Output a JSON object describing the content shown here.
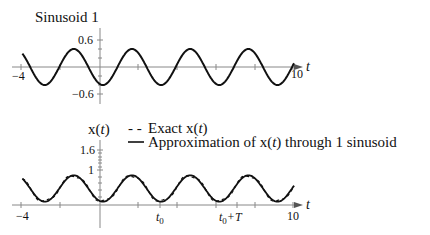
{
  "chart_data": [
    {
      "type": "line",
      "title": "Sinusoid 1",
      "xlabel": "t",
      "ylabel": "",
      "xlim": [
        -4,
        10
      ],
      "ylim": [
        -0.6,
        0.6
      ],
      "x_tick_labels": [
        "-4",
        "10"
      ],
      "y_tick_labels": [
        "0.6",
        "-0.6"
      ],
      "grid": false,
      "series": [
        {
          "name": "Sinusoid 1",
          "style": "solid",
          "amplitude": 0.4,
          "period": 3,
          "formula": "-0.4*cos(2*pi*(t-0.15)/3)"
        }
      ]
    },
    {
      "type": "line",
      "title": "",
      "xlabel": "t",
      "ylabel": "x(t)",
      "xlim": [
        -4,
        10
      ],
      "ylim": [
        0,
        1.6
      ],
      "x_tick_labels": [
        "-4",
        "t0",
        "t0+T",
        "10"
      ],
      "y_tick_labels": [
        "1.6",
        "1"
      ],
      "grid": false,
      "legend_position": "top-right",
      "series": [
        {
          "name": "Exact x(t)",
          "style": "dashed",
          "mean": 0.5,
          "amplitude": 0.4,
          "period": 3
        },
        {
          "name": "Approximation of x(t) through 1 sinusoid",
          "style": "solid",
          "mean": 0.5,
          "amplitude": 0.4,
          "period": 3
        }
      ]
    }
  ],
  "top": {
    "title": "Sinusoid 1",
    "ytick_pos": "0.6",
    "ytick_neg": "−0.6",
    "xtick_min": "−4",
    "xtick_max": "10",
    "xlabel": "t"
  },
  "bottom": {
    "ylabel_x": "x(",
    "ylabel_t": "t",
    "ylabel_close": ")",
    "ytick_top": "1.6",
    "ytick_one": "1",
    "xtick_min": "−4",
    "xtick_t0": "t",
    "xtick_t0_sub": "0",
    "xtick_t0T_t": "t",
    "xtick_t0T_sub": "0",
    "xtick_t0T_plus": "+T",
    "xtick_max": "10",
    "xlabel": "t",
    "legend": {
      "exact_marker": "- -",
      "exact_label_pre": "Exact x(",
      "exact_label_t": "t",
      "exact_label_post": ")",
      "approx_marker": "—",
      "approx_label_pre": "Approximation of x(",
      "approx_label_t": "t",
      "approx_label_post": ") through 1 sinusoid"
    }
  }
}
